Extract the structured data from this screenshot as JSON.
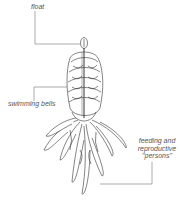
{
  "diagram": {
    "labels": {
      "float": "float",
      "swimming_bells": "swimming bells",
      "feeding_line1": "feeding and",
      "feeding_line2": "reproductive",
      "feeding_line3": "\"persons\""
    },
    "colors": {
      "line": "#777777",
      "ink": "#333333",
      "background": "#ffffff"
    }
  }
}
